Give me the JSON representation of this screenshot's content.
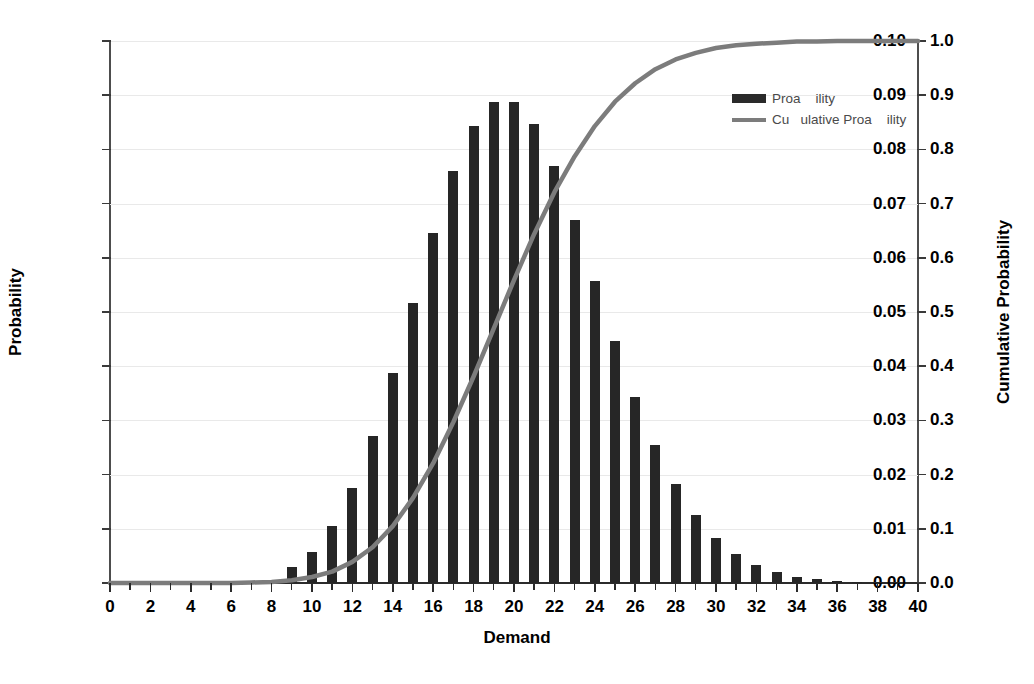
{
  "chart_data": {
    "type": "bar",
    "title": "",
    "xlabel": "Demand",
    "ylabel": "Probability",
    "y2label": "Cumulative Probability",
    "xlim": [
      0,
      40
    ],
    "ylim": [
      0,
      0.1
    ],
    "y2lim": [
      0,
      1.0
    ],
    "grid": true,
    "legend_position": "top-right",
    "x_tick_labels": [
      "0",
      "2",
      "4",
      "6",
      "8",
      "10",
      "12",
      "14",
      "16",
      "18",
      "20",
      "22",
      "24",
      "26",
      "28",
      "30",
      "32",
      "34",
      "36",
      "38",
      "40"
    ],
    "x_tick_values": [
      0,
      2,
      4,
      6,
      8,
      10,
      12,
      14,
      16,
      18,
      20,
      22,
      24,
      26,
      28,
      30,
      32,
      34,
      36,
      38,
      40
    ],
    "x_minor_tick_step": 1,
    "y_tick_labels": [
      "0.00",
      "0.01",
      "0.02",
      "0.03",
      "0.04",
      "0.05",
      "0.06",
      "0.07",
      "0.08",
      "0.09",
      "0.10"
    ],
    "y_tick_values": [
      0,
      0.01,
      0.02,
      0.03,
      0.04,
      0.05,
      0.06,
      0.07,
      0.08,
      0.09,
      0.1
    ],
    "y2_tick_labels": [
      "0.0",
      "0.1",
      "0.2",
      "0.3",
      "0.4",
      "0.5",
      "0.6",
      "0.7",
      "0.8",
      "0.9",
      "1.0"
    ],
    "y2_tick_values": [
      0,
      0.1,
      0.2,
      0.3,
      0.4,
      0.5,
      0.6,
      0.7,
      0.8,
      0.9,
      1.0
    ],
    "categories": [
      0,
      1,
      2,
      3,
      4,
      5,
      6,
      7,
      8,
      9,
      10,
      11,
      12,
      13,
      14,
      15,
      16,
      17,
      18,
      19,
      20,
      21,
      22,
      23,
      24,
      25,
      26,
      27,
      28,
      29,
      30,
      31,
      32,
      33,
      34,
      35,
      36,
      37,
      38,
      39,
      40
    ],
    "series": [
      {
        "name": "Proa    ility",
        "type": "bar",
        "axis": "left",
        "color": "#262626",
        "values": [
          0.0,
          0.0,
          0.0,
          0.0,
          0.0,
          0.0,
          0.0001,
          0.0002,
          0.0006,
          0.0029,
          0.0058,
          0.0106,
          0.0176,
          0.0271,
          0.0387,
          0.0516,
          0.0646,
          0.076,
          0.0844,
          0.0888,
          0.0888,
          0.0846,
          0.0769,
          0.0669,
          0.0557,
          0.0446,
          0.0343,
          0.0254,
          0.0182,
          0.0125,
          0.0083,
          0.0054,
          0.0034,
          0.002,
          0.0012,
          0.0007,
          0.0004,
          0.0002,
          0.0001,
          0.0001,
          0.0
        ]
      },
      {
        "name": "Cu   ulative Proa    ility",
        "type": "line",
        "axis": "right",
        "color": "#7c7c7c",
        "values": [
          0.0,
          0.0,
          0.0,
          0.0,
          0.0,
          0.0,
          0.0,
          0.001,
          0.002,
          0.005,
          0.011,
          0.021,
          0.039,
          0.066,
          0.105,
          0.157,
          0.221,
          0.297,
          0.381,
          0.47,
          0.559,
          0.644,
          0.721,
          0.787,
          0.843,
          0.888,
          0.922,
          0.948,
          0.966,
          0.978,
          0.987,
          0.992,
          0.995,
          0.997,
          0.999,
          0.999,
          1.0,
          1.0,
          1.0,
          1.0,
          1.0
        ]
      }
    ]
  },
  "legend": {
    "items": [
      {
        "label": "Proa    ility",
        "marker": "bar-swatch-icon"
      },
      {
        "label": "Cu   ulative Proa    ility",
        "marker": "line-swatch-icon"
      }
    ]
  }
}
